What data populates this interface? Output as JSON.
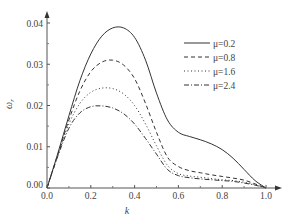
{
  "chart_data": {
    "type": "line",
    "title": "",
    "xlabel": "k",
    "ylabel": "ω_r",
    "xlim": [
      0.0,
      1.0
    ],
    "ylim": [
      0.0,
      0.04
    ],
    "x_ticks": [
      "0.0",
      "0.2",
      "0.4",
      "0.6",
      "0.8",
      "1.0"
    ],
    "y_ticks": [
      "0.00",
      "0.01",
      "0.02",
      "0.03",
      "0.04"
    ],
    "grid": false,
    "legend_position": "upper right",
    "x": [
      0.0,
      0.05,
      0.1,
      0.15,
      0.2,
      0.25,
      0.3,
      0.35,
      0.4,
      0.45,
      0.5,
      0.55,
      0.6,
      0.65,
      0.7,
      0.75,
      0.8,
      0.85,
      0.9,
      0.95,
      1.0
    ],
    "series": [
      {
        "name": "μ=0.2",
        "style": "solid",
        "values": [
          0.0,
          0.0085,
          0.0175,
          0.026,
          0.0325,
          0.0368,
          0.0388,
          0.0388,
          0.0365,
          0.031,
          0.023,
          0.0165,
          0.0135,
          0.0125,
          0.0117,
          0.0107,
          0.0093,
          0.0072,
          0.0045,
          0.0018,
          0.0
        ]
      },
      {
        "name": "μ=0.8",
        "style": "dashed",
        "values": [
          0.0,
          0.0082,
          0.0165,
          0.0235,
          0.0282,
          0.0305,
          0.031,
          0.0298,
          0.0265,
          0.0205,
          0.0135,
          0.0075,
          0.0052,
          0.0042,
          0.0037,
          0.0032,
          0.0028,
          0.0024,
          0.0019,
          0.001,
          0.0
        ]
      },
      {
        "name": "μ=1.6",
        "style": "dotted",
        "values": [
          0.0,
          0.008,
          0.0155,
          0.0205,
          0.0232,
          0.0242,
          0.0241,
          0.0228,
          0.02,
          0.0155,
          0.0102,
          0.0055,
          0.0035,
          0.0029,
          0.0026,
          0.0023,
          0.002,
          0.0018,
          0.0014,
          0.0008,
          0.0
        ]
      },
      {
        "name": "μ=2.4",
        "style": "dash-dot",
        "values": [
          0.0,
          0.0078,
          0.0145,
          0.0182,
          0.0197,
          0.0199,
          0.0194,
          0.018,
          0.0155,
          0.012,
          0.0082,
          0.0045,
          0.003,
          0.0025,
          0.0022,
          0.002,
          0.0018,
          0.0016,
          0.0012,
          0.0007,
          0.0
        ]
      }
    ]
  },
  "legend": {
    "items": [
      {
        "label": "μ=0.2"
      },
      {
        "label": "μ=0.8"
      },
      {
        "label": "μ=1.6"
      },
      {
        "label": "μ=2.4"
      }
    ]
  },
  "axes": {
    "xlabel": "k",
    "ylabel_main": "ω",
    "ylabel_sub": "r"
  }
}
